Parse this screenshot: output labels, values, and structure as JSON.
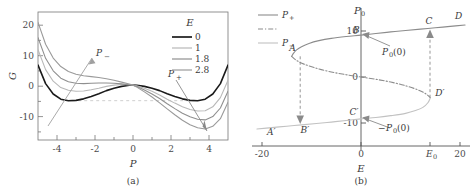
{
  "figure": {
    "panel_a_caption": "(a)",
    "panel_b_caption": "(b)"
  },
  "chart_data": [
    {
      "id": "panel_a",
      "type": "line",
      "title": "",
      "xlabel": "P",
      "ylabel": "G",
      "xlim": [
        -5,
        5
      ],
      "ylim": [
        -18,
        24
      ],
      "xticks": [
        "-4",
        "-2",
        "0",
        "2",
        "4"
      ],
      "xtick_values": [
        -4,
        -2,
        0,
        2,
        4
      ],
      "yticks": [
        "20",
        "10",
        "0",
        "-10"
      ],
      "ytick_values": [
        20,
        10,
        0,
        -10
      ],
      "grid": false,
      "frame": "box",
      "legend_title": "E",
      "legend_position": "top-right",
      "series": [
        {
          "name": "0",
          "label": "0",
          "color": "#1a1a1a",
          "width": 1.6,
          "E": 0,
          "x": [
            -5,
            -4.6,
            -4.2,
            -3.8,
            -3.4,
            -3,
            -2.6,
            -2.2,
            -1.8,
            -1.4,
            -1,
            -0.6,
            -0.2,
            0,
            0.2,
            0.6,
            1,
            1.4,
            1.8,
            2.2,
            2.6,
            3,
            3.4,
            3.8,
            4.2,
            4.6,
            5
          ],
          "y": [
            6.6,
            0.5,
            -2.9,
            -4.6,
            -5.1,
            -5.0,
            -4.5,
            -3.7,
            -2.8,
            -1.8,
            -1.0,
            -0.4,
            -0.05,
            0,
            -0.05,
            -0.4,
            -1.0,
            -1.8,
            -2.8,
            -3.7,
            -4.5,
            -5.0,
            -5.1,
            -4.6,
            -2.9,
            0.5,
            6.6
          ]
        },
        {
          "name": "1",
          "label": "1",
          "color": "#b8b8b8",
          "width": 1.1,
          "E": 1,
          "x": [
            -5,
            -4.6,
            -4.2,
            -3.8,
            -3.4,
            -3,
            -2.6,
            -2.2,
            -1.8,
            -1.4,
            -1,
            -0.6,
            -0.2,
            0,
            0.2,
            0.6,
            1,
            1.4,
            1.8,
            2.2,
            2.6,
            3,
            3.4,
            3.8,
            4.2,
            4.6,
            5
          ],
          "y": [
            11.6,
            5.1,
            1.3,
            -0.8,
            -1.7,
            -2.0,
            -1.9,
            -1.5,
            -1.0,
            -0.4,
            0.0,
            0.2,
            0.15,
            0,
            -0.25,
            -1.0,
            -2.0,
            -3.2,
            -4.6,
            -5.9,
            -7.1,
            -8.0,
            -8.5,
            -8.4,
            -7.1,
            -4.1,
            1.6
          ]
        },
        {
          "name": "1.8",
          "label": "1.8",
          "color": "#8f8f8f",
          "width": 1.1,
          "E": 1.8,
          "x": [
            -5,
            -4.6,
            -4.2,
            -3.8,
            -3.4,
            -3,
            -2.6,
            -2.2,
            -1.8,
            -1.4,
            -1,
            -0.6,
            -0.2,
            0,
            0.2,
            0.6,
            1,
            1.4,
            1.8,
            2.2,
            2.6,
            3,
            3.4,
            3.8,
            4.2,
            4.6,
            5
          ],
          "y": [
            15.6,
            8.8,
            4.7,
            2.3,
            1.1,
            0.6,
            0.5,
            0.6,
            0.7,
            0.7,
            0.6,
            0.4,
            0.1,
            0,
            -0.45,
            -1.6,
            -2.9,
            -4.4,
            -6.1,
            -7.7,
            -9.2,
            -10.4,
            -11.2,
            -11.4,
            -10.3,
            -7.5,
            -2.0
          ]
        },
        {
          "name": "2.8",
          "label": "2.8",
          "color": "#9a9a9a",
          "width": 1.1,
          "E": 2.8,
          "x": [
            -5,
            -4.6,
            -4.2,
            -3.8,
            -3.4,
            -3,
            -2.6,
            -2.2,
            -1.8,
            -1.4,
            -1,
            -0.6,
            -0.2,
            0,
            0.2,
            0.6,
            1,
            1.4,
            1.8,
            2.2,
            2.6,
            3,
            3.4,
            3.8,
            4.2,
            4.6,
            5
          ],
          "y": [
            20.6,
            13.4,
            8.9,
            6.1,
            4.5,
            3.6,
            3.1,
            2.8,
            2.5,
            2.1,
            1.6,
            1.0,
            0.35,
            0,
            -0.65,
            -2.2,
            -3.9,
            -5.8,
            -7.8,
            -9.7,
            -11.5,
            -13.0,
            -14.0,
            -14.4,
            -13.5,
            -11.0,
            -5.6
          ]
        }
      ],
      "annotations": [
        {
          "name": "P-minus-arrow",
          "label": "P−",
          "label_text": "P",
          "sub": "−",
          "x": -2.25,
          "y": 11.5
        },
        {
          "name": "P-plus-arrow",
          "label": "P+",
          "label_text": "P",
          "sub": "+",
          "x": 2.6,
          "y": 1.2
        }
      ],
      "guide_line": {
        "name": "minimum-level-dashed",
        "y": -5.1,
        "x_from": -3.2,
        "x_to": 3.2,
        "color": "#cfcfcf"
      }
    },
    {
      "id": "panel_b",
      "type": "line",
      "title": "",
      "xlabel": "E",
      "ylabel": "P0",
      "xlim": [
        -22,
        22
      ],
      "ylim": [
        -15,
        15
      ],
      "xticks": [
        "-20",
        "0",
        "E0",
        "20"
      ],
      "xtick_values": [
        -20,
        0,
        14,
        20
      ],
      "yticks": [
        "10",
        "0",
        "-10"
      ],
      "ytick_values": [
        10,
        0,
        -10
      ],
      "grid": false,
      "frame": "cross",
      "legend_position": "top-left",
      "legend_entries": [
        {
          "name": "P-plus",
          "label": "P+",
          "label_text": "P",
          "sub": "+",
          "style": "solid",
          "color": "#8c8c8c"
        },
        {
          "name": "P-zero-unstable",
          "label": "",
          "label_text": "",
          "sub": "",
          "style": "dashdot",
          "color": "#8c8c8c"
        },
        {
          "name": "P-minus",
          "label": "P−",
          "label_text": "P",
          "sub": "−",
          "style": "solid",
          "color": "#c2c2c2"
        }
      ],
      "branches": [
        {
          "name": "upper-stable-branch",
          "style": "solid",
          "color": "#8c8c8c",
          "x": [
            -14,
            -13.6,
            -13,
            -12,
            -10.5,
            -8.5,
            -6,
            -3,
            0,
            3,
            6,
            9,
            12,
            15,
            18,
            21
          ],
          "y": [
            4.5,
            5.2,
            5.9,
            6.6,
            7.3,
            7.9,
            8.4,
            8.8,
            9.1,
            9.45,
            9.8,
            10.1,
            10.4,
            10.7,
            11.0,
            11.3
          ]
        },
        {
          "name": "unstable-middle-branch",
          "style": "dashdot",
          "color": "#8c8c8c",
          "x": [
            -14,
            -13,
            -11.5,
            -9,
            -6,
            -3,
            0,
            3,
            6,
            9,
            11.5,
            13,
            14
          ],
          "y": [
            4.5,
            3.6,
            2.8,
            1.9,
            1.1,
            0.5,
            0.0,
            -0.5,
            -1.1,
            -1.9,
            -2.8,
            -3.6,
            -4.5
          ]
        },
        {
          "name": "lower-stable-branch",
          "style": "solid",
          "color": "#c2c2c2",
          "x": [
            -21,
            -18,
            -15,
            -12,
            -9,
            -6,
            -3,
            0,
            3,
            6,
            9,
            11,
            12.5,
            13.5,
            14
          ],
          "y": [
            -11.3,
            -11.0,
            -10.7,
            -10.4,
            -10.1,
            -9.8,
            -9.45,
            -9.1,
            -8.8,
            -8.4,
            -7.9,
            -7.3,
            -6.6,
            -5.6,
            -4.5
          ]
        }
      ],
      "hysteresis_arrows": [
        {
          "name": "arrow-A-to-Bprime",
          "from_x": -12.2,
          "from_y": 4.5,
          "to_x": -12.2,
          "to_y": -10.4,
          "direction": "down"
        },
        {
          "name": "arrow-Dprime-to-C",
          "from_x": 14,
          "from_y": -4.5,
          "to_x": 14,
          "to_y": 10.5,
          "direction": "up"
        }
      ],
      "point_labels": [
        {
          "name": "point-A",
          "label": "A",
          "x": -14.5,
          "y": 5.6
        },
        {
          "name": "point-B",
          "label": "B",
          "x": -1.6,
          "y": 9.6
        },
        {
          "name": "point-C",
          "label": "C",
          "x": 13.0,
          "y": 11.5
        },
        {
          "name": "point-D",
          "label": "D",
          "x": 19.0,
          "y": 12.6
        },
        {
          "name": "point-A-prime",
          "label": "A′",
          "x": -19.0,
          "y": -12.6
        },
        {
          "name": "point-B-prime",
          "label": "B′",
          "x": -12.2,
          "y": -12.1
        },
        {
          "name": "point-C-prime",
          "label": "C′",
          "x": -2.3,
          "y": -8.2
        },
        {
          "name": "point-D-prime",
          "label": "D′",
          "x": 15.0,
          "y": -4.1
        }
      ],
      "callouts": [
        {
          "name": "callout-P0-zero",
          "label": "P0(0)",
          "target_x": 0,
          "target_y": 9.1
        },
        {
          "name": "callout-neg-P0-zero",
          "label": "-P0(0)",
          "target_x": 0,
          "target_y": -9.1
        }
      ]
    }
  ]
}
